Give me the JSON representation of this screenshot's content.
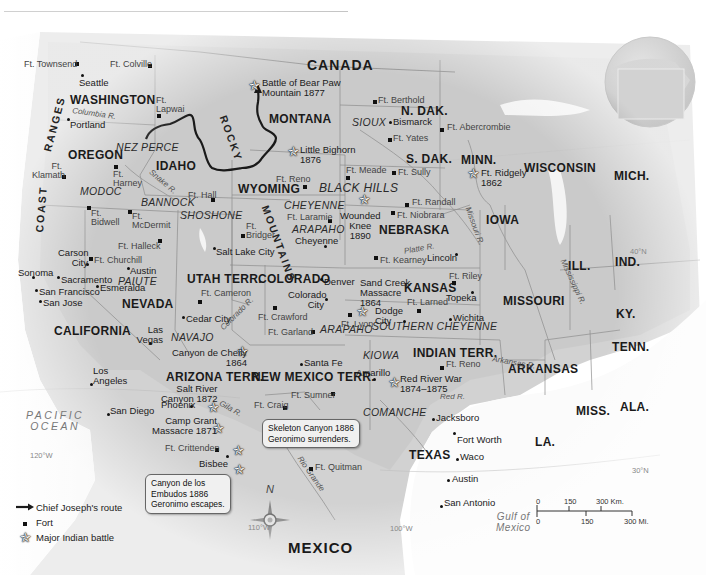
{
  "map": {
    "countries": [
      "CANADA",
      "MEXICO"
    ],
    "oceans": [
      {
        "name": "PACIFIC OCEAN",
        "lines": [
          "PACIFIC",
          "OCEAN"
        ]
      },
      {
        "name": "Gulf of Mexico",
        "lines": [
          "Gulf of",
          "Mexico"
        ]
      }
    ],
    "states": [
      "WASHINGTON",
      "OREGON",
      "IDAHO",
      "MONTANA",
      "WYOMING",
      "N. DAK.",
      "S. DAK.",
      "NEBRASKA",
      "MINN.",
      "WISCONSIN",
      "MICH.",
      "IOWA",
      "ILL.",
      "IND.",
      "KY.",
      "TENN.",
      "MISSOURI",
      "KANSAS",
      "COLORADO",
      "UTAH TERR.",
      "NEVADA",
      "CALIFORNIA",
      "ARIZONA TERR.",
      "NEW MEXICO TERR.",
      "INDIAN TERR.",
      "ARKANSAS",
      "TEXAS",
      "LA.",
      "MISS.",
      "ALA."
    ],
    "tribes": [
      "NEZ PERCE",
      "SIOUX",
      "MODOC",
      "BANNOCK",
      "SHOSHONE",
      "CHEYENNE",
      "ARAPAHO",
      "BLACK HILLS",
      "PAIUTE",
      "NAVAJO",
      "ARAPAHO",
      "SOUTHERN CHEYENNE",
      "KIOWA",
      "COMANCHE"
    ],
    "mountains": [
      "RANGES",
      "COAST",
      "ROCKY",
      "MOUNTAINS"
    ],
    "rivers": [
      "Columbia R.",
      "Snake R.",
      "Missouri R.",
      "Platte R.",
      "Mississippi R.",
      "Colorado R.",
      "Gila R.",
      "Arkansas R.",
      "Red R.",
      "Rio Grande"
    ],
    "cities": [
      "Seattle",
      "Portland",
      "Bismarck",
      "Salt Lake City",
      "Carson City",
      "Sonoma",
      "Sacramento",
      "San Francisco",
      "San Jose",
      "Austin",
      "Esmeralda",
      "Cedar City",
      "Las Vegas",
      "Denver",
      "Colorado City",
      "Cheyenne",
      "Lincoln",
      "Topeka",
      "Dodge City",
      "Wichita",
      "Santa Fe",
      "Amarillo",
      "Los Angeles",
      "San Diego",
      "Phoenix",
      "Bisbee",
      "Jacksboro",
      "Fort Worth",
      "Waco",
      "Austin",
      "San Antonio"
    ],
    "forts": [
      "Ft. Townsend",
      "Ft. Colville",
      "Ft. Lapwai",
      "Ft. Klamath",
      "Ft. Harney",
      "Ft. Hall",
      "Ft. Reno",
      "Ft. Berthold",
      "Ft. Yates",
      "Ft. Abercrombie",
      "Ft. Meade",
      "Ft. Sully",
      "Ft. Randall",
      "Ft. Niobrara",
      "Ft. Laramie",
      "Ft. Bridger",
      "Ft. Bidwell",
      "Ft. McDermit",
      "Ft. Halleck",
      "Ft. Churchill",
      "Ft. Kearney",
      "Ft. Riley",
      "Ft. Larned",
      "Ft. Lyon",
      "Ft. Cameron",
      "Ft. Crawford",
      "Ft. Garland",
      "Ft. Sumner",
      "Ft. Craig",
      "Ft. Reno",
      "Ft. Crittenden",
      "Ft. Quitman"
    ],
    "battles": [
      {
        "name": "Battle of Bear Paw Mountain 1877",
        "lines": [
          "Battle of Bear Paw",
          "Mountain 1877"
        ]
      },
      {
        "name": "Little Bighorn 1876",
        "lines": [
          "Little Bighorn",
          "1876"
        ]
      },
      {
        "name": "Ft. Ridgely 1862",
        "lines": [
          "Ft. Ridgely",
          "1862"
        ]
      },
      {
        "name": "Wounded Knee 1890",
        "lines": [
          "Wounded",
          "Knee",
          "1890"
        ]
      },
      {
        "name": "Sand Creek Massacre 1864",
        "lines": [
          "Sand Creek",
          "Massacre",
          "1864"
        ]
      },
      {
        "name": "Canyon de Chelly 1864",
        "lines": [
          "Canyon de Chelly",
          "1864"
        ]
      },
      {
        "name": "Red River War 1874–1875",
        "lines": [
          "Red River War",
          "1874–1875"
        ]
      },
      {
        "name": "Salt River Canyon 1872",
        "lines": [
          "Salt River",
          "Canyon 1872"
        ]
      },
      {
        "name": "Camp Grant Massacre 1871",
        "lines": [
          "Camp Grant",
          "Massacre 1871"
        ]
      }
    ],
    "callouts": [
      {
        "lines": [
          "Skeleton Canyon 1886",
          "Geronimo surrenders."
        ]
      },
      {
        "lines": [
          "Canyon de los",
          "Embudos 1886",
          "Geronimo escapes."
        ]
      }
    ],
    "latlong": [
      "120°W",
      "110°W",
      "100°W",
      "40°N",
      "30°N"
    ],
    "compass": "N"
  },
  "legend": {
    "items": [
      {
        "icon": "arrow-route-icon",
        "label": "Chief Joseph's route"
      },
      {
        "icon": "fort-square-icon",
        "label": "Fort"
      },
      {
        "icon": "battle-star-icon",
        "label": "Major Indian battle"
      }
    ]
  },
  "scale": {
    "km": [
      "0",
      "150",
      "300 Km."
    ],
    "mi": [
      "0",
      "150",
      "300 Mi."
    ]
  }
}
